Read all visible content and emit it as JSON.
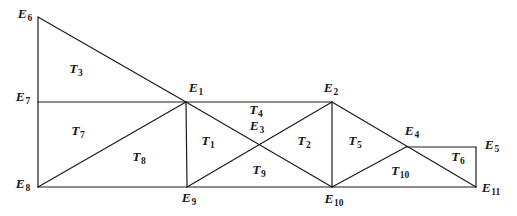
{
  "figure": {
    "background_color": "#ffffff",
    "line_color": "#1c1c1c",
    "line_width": 1.2,
    "width": 517,
    "height": 216,
    "vertices": {
      "E1": {
        "x": 186,
        "y": 102
      },
      "E2": {
        "x": 332,
        "y": 102
      },
      "E3": {
        "x": 259,
        "y": 146
      },
      "E4": {
        "x": 406,
        "y": 147
      },
      "E5": {
        "x": 476,
        "y": 147
      },
      "E6": {
        "x": 38,
        "y": 17
      },
      "E7": {
        "x": 38,
        "y": 102
      },
      "E8": {
        "x": 38,
        "y": 187
      },
      "E9": {
        "x": 187,
        "y": 187
      },
      "E10": {
        "x": 332,
        "y": 187
      },
      "E11": {
        "x": 476,
        "y": 187
      }
    },
    "edges": [
      [
        "E6",
        "E8"
      ],
      [
        "E7",
        "E2"
      ],
      [
        "E8",
        "E11"
      ],
      [
        "E6",
        "E1"
      ],
      [
        "E8",
        "E1"
      ],
      [
        "E1",
        "E9"
      ],
      [
        "E1",
        "E10"
      ],
      [
        "E9",
        "E2"
      ],
      [
        "E2",
        "E10"
      ],
      [
        "E2",
        "E11"
      ],
      [
        "E10",
        "E4"
      ],
      [
        "E4",
        "E5"
      ],
      [
        "E5",
        "E11"
      ]
    ],
    "labels": [
      {
        "id": "E6",
        "base": "E",
        "sub": "6",
        "x": 25,
        "y": 16
      },
      {
        "id": "E7",
        "base": "E",
        "sub": "7",
        "x": 23,
        "y": 99
      },
      {
        "id": "E8",
        "base": "E",
        "sub": "8",
        "x": 23,
        "y": 186
      },
      {
        "id": "E1",
        "base": "E",
        "sub": "1",
        "x": 196,
        "y": 90
      },
      {
        "id": "E2",
        "base": "E",
        "sub": "2",
        "x": 331,
        "y": 90
      },
      {
        "id": "E3",
        "base": "E",
        "sub": "3",
        "x": 257,
        "y": 128
      },
      {
        "id": "E4",
        "base": "E",
        "sub": "4",
        "x": 412,
        "y": 133
      },
      {
        "id": "E5",
        "base": "E",
        "sub": "5",
        "x": 492,
        "y": 147
      },
      {
        "id": "E9",
        "base": "E",
        "sub": "9",
        "x": 189,
        "y": 200
      },
      {
        "id": "E10",
        "base": "E",
        "sub": "10",
        "x": 334,
        "y": 201
      },
      {
        "id": "E11",
        "base": "E",
        "sub": "11",
        "x": 491,
        "y": 190
      },
      {
        "id": "T3",
        "base": "T",
        "sub": "3",
        "x": 76,
        "y": 71
      },
      {
        "id": "T7",
        "base": "T",
        "sub": "7",
        "x": 78,
        "y": 133
      },
      {
        "id": "T8",
        "base": "T",
        "sub": "8",
        "x": 139,
        "y": 159
      },
      {
        "id": "T1",
        "base": "T",
        "sub": "1",
        "x": 208,
        "y": 143
      },
      {
        "id": "T4",
        "base": "T",
        "sub": "4",
        "x": 256,
        "y": 112
      },
      {
        "id": "T9",
        "base": "T",
        "sub": "9",
        "x": 259,
        "y": 172
      },
      {
        "id": "T2",
        "base": "T",
        "sub": "2",
        "x": 304,
        "y": 143
      },
      {
        "id": "T5",
        "base": "T",
        "sub": "5",
        "x": 355,
        "y": 143
      },
      {
        "id": "T10",
        "base": "T",
        "sub": "10",
        "x": 400,
        "y": 173
      },
      {
        "id": "T6",
        "base": "T",
        "sub": "6",
        "x": 458,
        "y": 159
      }
    ]
  }
}
